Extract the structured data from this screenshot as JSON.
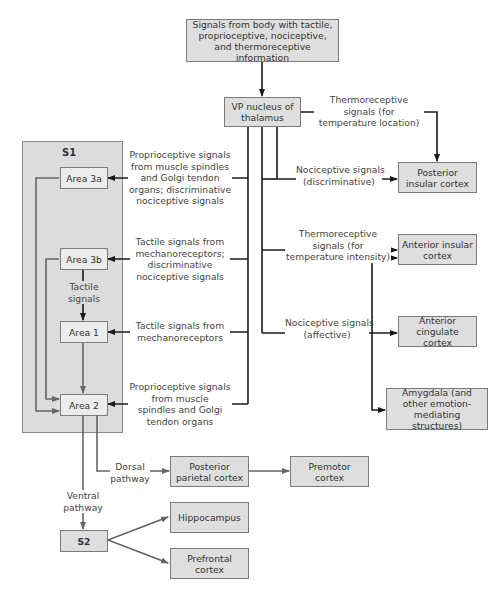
{
  "diagram": {
    "colors": {
      "box_fill": "#dedede",
      "inner_box_fill": "#ececec",
      "s1_region_fill": "#dcdcdc",
      "line_dark": "#1a1a1a",
      "line_gray": "#666666"
    },
    "nodes": {
      "source": "Signals from body with tactile, proprioceptive, nociceptive, and thermoreceptive information",
      "vp_nucleus": "VP nucleus of thalamus",
      "s1": "S1",
      "area_3a": "Area 3a",
      "area_3b": "Area 3b",
      "area_1": "Area 1",
      "area_2": "Area 2",
      "s2": "S2",
      "posterior_insular": "Posterior insular cortex",
      "anterior_insular": "Anterior insular cortex",
      "anterior_cingulate": "Anterior cingulate cortex",
      "amygdala": "Amygdala (and other emotion-mediating structures)",
      "posterior_parietal": "Posterior parietal cortex",
      "premotor": "Premotor cortex",
      "hippocampus": "Hippocampus",
      "prefrontal": "Prefrontal cortex"
    },
    "edge_labels": {
      "thermo_location": [
        "Thermoreceptive",
        "signals (for",
        "temperature location)"
      ],
      "noci_discriminative": [
        "Nociceptive signals",
        "(discriminative)"
      ],
      "thermo_intensity": [
        "Thermoreceptive",
        "signals (for",
        "temperature intensity)"
      ],
      "noci_affective": [
        "Nociceptive signals",
        "(affective)"
      ],
      "to_3a": [
        "Proprioceptive signals",
        "from muscle spindles",
        "and Golgi tendon",
        "organs; discriminative",
        "nociceptive signals"
      ],
      "to_3b": [
        "Tactile signals from",
        "mechanoreceptors;",
        "discriminative",
        "nociceptive signals"
      ],
      "to_1": [
        "Tactile signals from",
        "mechanoreceptors"
      ],
      "to_2": [
        "Proprioceptive signals",
        "from muscle",
        "spindles and Golgi",
        "tendon organs"
      ],
      "tactile_3b_1": [
        "Tactile",
        "signals"
      ],
      "dorsal": [
        "Dorsal",
        "pathway"
      ],
      "ventral": [
        "Ventral",
        "pathway"
      ]
    }
  }
}
